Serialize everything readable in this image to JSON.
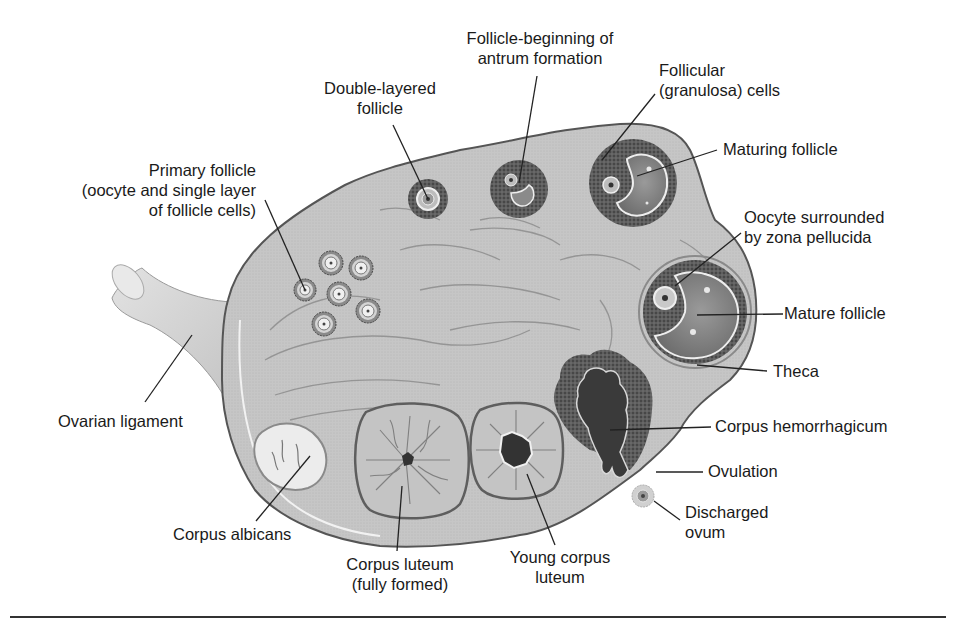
{
  "diagram": {
    "colors": {
      "stroma": "#c8c8c8",
      "stroma_dark": "#a9a9a9",
      "outline": "#5a5a5a",
      "granulosa": "#5e5e5e",
      "antrum": "#8d8d8d",
      "corpus_luteum": "#bdbdbd",
      "hemorrhagic": "#3e3e3e",
      "albicans": "#ececec",
      "leader_line": "#222222",
      "rule": "#333333"
    },
    "labels": {
      "primary_follicle": [
        "Primary follicle",
        "(oocyte and single layer",
        "of follicle cells)"
      ],
      "double_layered": [
        "Double-layered",
        "follicle"
      ],
      "antrum_formation": [
        "Follicle-beginning of",
        "antrum formation"
      ],
      "granulosa_cells": [
        "Follicular",
        "(granulosa) cells"
      ],
      "maturing_follicle": [
        "Maturing follicle"
      ],
      "oocyte_zona": [
        "Oocyte surrounded",
        "by zona pellucida"
      ],
      "mature_follicle": [
        "Mature follicle"
      ],
      "theca": [
        "Theca"
      ],
      "ovarian_ligament": [
        "Ovarian ligament"
      ],
      "corpus_hemorrhagicum": [
        "Corpus hemorrhagicum"
      ],
      "ovulation": [
        "Ovulation"
      ],
      "discharged_ovum": [
        "Discharged",
        "ovum"
      ],
      "corpus_albicans": [
        "Corpus albicans"
      ],
      "corpus_luteum_full": [
        "Corpus luteum",
        "(fully formed)"
      ],
      "young_corpus_luteum": [
        "Young corpus",
        "luteum"
      ]
    }
  }
}
